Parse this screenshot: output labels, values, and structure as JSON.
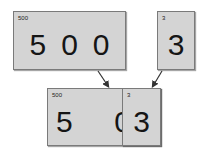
{
  "top_left_card": {
    "label": "500",
    "digits": [
      "5",
      "0",
      "0"
    ]
  },
  "top_right_card": {
    "label": "3",
    "digits": [
      "3"
    ]
  },
  "combined_card": {
    "back": {
      "label": "500",
      "digits": [
        "5",
        "0"
      ]
    },
    "front": {
      "label": "3",
      "digits": [
        "3"
      ]
    }
  },
  "colors": {
    "card_fill": "#d4d4d4",
    "card_border": "#7a7a7a",
    "arrow": "#333333"
  }
}
